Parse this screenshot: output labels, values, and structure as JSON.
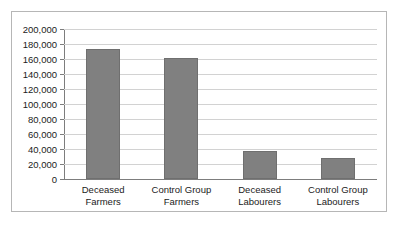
{
  "chart_data": {
    "type": "bar",
    "title": "",
    "subtitle": "",
    "xlabel": "",
    "ylabel": "",
    "categories": [
      "Deceased\nFarmers",
      "Control Group\nFarmers",
      "Deceased\nLabourers",
      "Control Group\nLabourers"
    ],
    "category_lines": [
      [
        "Deceased",
        "Farmers"
      ],
      [
        "Control Group",
        "Farmers"
      ],
      [
        "Deceased",
        "Labourers"
      ],
      [
        "Control Group",
        "Labourers"
      ]
    ],
    "values": [
      173000,
      161000,
      38000,
      28000
    ],
    "ylim": [
      0,
      200000
    ],
    "ytick_step": 20000,
    "ytick_labels": [
      "200,000",
      "180,000",
      "160,000",
      "140,000",
      "120,000",
      "100,000",
      "80,000",
      "60,000",
      "40,000",
      "20,000",
      "0"
    ],
    "ytick_values": [
      200000,
      180000,
      160000,
      140000,
      120000,
      100000,
      80000,
      60000,
      40000,
      20000,
      0
    ],
    "grid": true,
    "grid_axis": "y",
    "legend": false,
    "legend_position": "none",
    "series": [
      {
        "name": "",
        "values": [
          173000,
          161000,
          38000,
          28000
        ]
      }
    ]
  },
  "style": {
    "bar_color": "#808080",
    "bar_border_color": "#6f6f6f",
    "gridline_color": "#d2d2d2",
    "axis_color": "#7d7d7d",
    "frame_border_color": "#b6b6b6",
    "background_color": "#ffffff",
    "text_color": "#1b1b1b"
  }
}
